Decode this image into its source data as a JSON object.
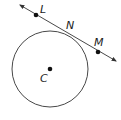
{
  "diagram": {
    "type": "geometry-circle-tangent",
    "circle": {
      "center_label": "C",
      "cx": 50,
      "cy": 69,
      "r": 38,
      "stroke": "#333333"
    },
    "tangent_line": {
      "x1": 20,
      "y1": 5,
      "x2": 116,
      "y2": 61,
      "stroke": "#333333",
      "arrows": "both"
    },
    "points": [
      {
        "label": "L",
        "x": 36,
        "y": 15,
        "label_x": 40,
        "label_y": 12
      },
      {
        "label": "N",
        "x": 67,
        "y": 33,
        "label_x": 68,
        "label_y": 28,
        "dot": false
      },
      {
        "label": "M",
        "x": 98,
        "y": 52,
        "label_x": 95,
        "label_y": 44
      },
      {
        "label": "C",
        "x": 50,
        "y": 69,
        "label_x": 41,
        "label_y": 81
      }
    ],
    "labels": {
      "L": "L",
      "N": "N",
      "M": "M",
      "C": "C"
    }
  }
}
